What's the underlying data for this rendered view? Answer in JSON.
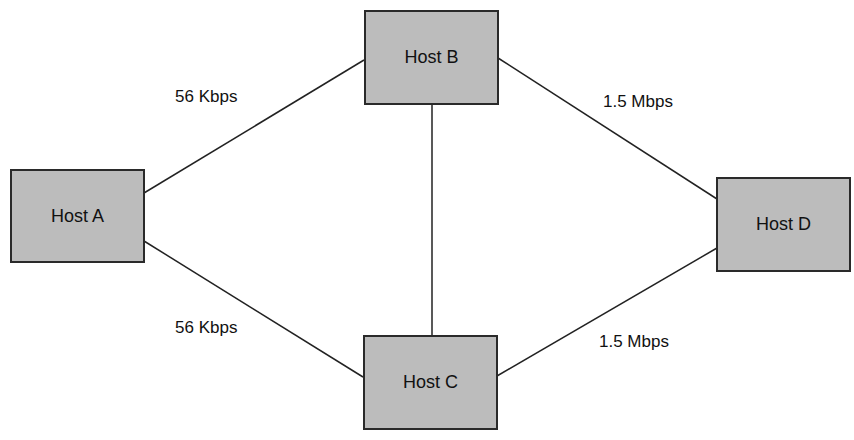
{
  "diagram": {
    "hosts": [
      {
        "id": "A",
        "label": "Host A",
        "x": 10,
        "y": 169,
        "w": 135,
        "h": 94
      },
      {
        "id": "B",
        "label": "Host B",
        "x": 364,
        "y": 10,
        "w": 135,
        "h": 95
      },
      {
        "id": "C",
        "label": "Host C",
        "x": 363,
        "y": 335,
        "w": 135,
        "h": 95
      },
      {
        "id": "D",
        "label": "Host D",
        "x": 716,
        "y": 177,
        "w": 135,
        "h": 95
      }
    ],
    "links": [
      {
        "from": "A",
        "to": "B",
        "x1": 144,
        "y1": 193,
        "x2": 364,
        "y2": 60,
        "label": "56 Kbps"
      },
      {
        "from": "A",
        "to": "C",
        "x1": 144,
        "y1": 241,
        "x2": 363,
        "y2": 377,
        "label": "56 Kbps"
      },
      {
        "from": "B",
        "to": "C",
        "x1": 432,
        "y1": 104,
        "x2": 432,
        "y2": 335,
        "label": ""
      },
      {
        "from": "B",
        "to": "D",
        "x1": 498,
        "y1": 58,
        "x2": 717,
        "y2": 199,
        "label": "1.5 Mbps"
      },
      {
        "from": "C",
        "to": "D",
        "x1": 497,
        "y1": 376,
        "x2": 717,
        "y2": 248,
        "label": "1.5 Mbps"
      }
    ],
    "link_labels": [
      {
        "text": "56 Kbps",
        "x": 175,
        "y": 87
      },
      {
        "text": "56 Kbps",
        "x": 175,
        "y": 318
      },
      {
        "text": "1.5 Mbps",
        "x": 603,
        "y": 92
      },
      {
        "text": "1.5 Mbps",
        "x": 599,
        "y": 332
      }
    ],
    "colors": {
      "box_fill": "#bcbcbc",
      "box_border": "#2a2a2a",
      "line": "#222222"
    }
  }
}
